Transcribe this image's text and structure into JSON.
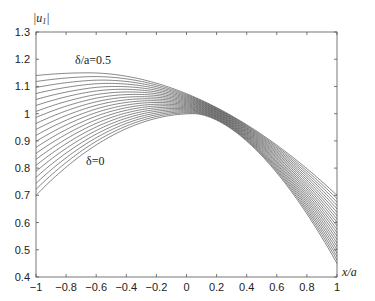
{
  "chart_data": {
    "type": "line",
    "title": "",
    "xlabel": "x/a",
    "ylabel": "|u_1|",
    "xlim": [
      -1,
      1
    ],
    "ylim": [
      0.4,
      1.3
    ],
    "grid": false,
    "xticks": [
      -1,
      -0.8,
      -0.6,
      -0.4,
      -0.2,
      0,
      0.2,
      0.4,
      0.6,
      0.8,
      1
    ],
    "xtick_labels": [
      "−1",
      "−0.8",
      "−0.6",
      "−0.4",
      "−0.2",
      "0",
      "0.2",
      "0.4",
      "0.6",
      "0.8",
      "1"
    ],
    "yticks": [
      0.4,
      0.5,
      0.6,
      0.7,
      0.8,
      0.9,
      1,
      1.1,
      1.2,
      1.3
    ],
    "ytick_labels": [
      "0.4",
      "0.5",
      "0.6",
      "0.7",
      "0.8",
      "0.9",
      "1",
      "1.1",
      "1.2",
      "1.3"
    ],
    "annotations": [
      {
        "text": "δ/a=0.5",
        "x": -0.72,
        "y": 1.19
      },
      {
        "text": "δ=0",
        "x": -0.62,
        "y": 0.795
      }
    ],
    "series_parameter": "δ/a",
    "series_parameter_values": [
      0,
      0.025,
      0.05,
      0.075,
      0.1,
      0.125,
      0.15,
      0.175,
      0.2,
      0.225,
      0.25,
      0.275,
      0.3,
      0.325,
      0.35,
      0.375,
      0.4,
      0.425,
      0.45,
      0.475,
      0.5
    ],
    "series": [
      {
        "name": "δ=0",
        "x": [
          -1,
          -0.5,
          0,
          0.05,
          0.5,
          1
        ],
        "values": [
          0.7,
          0.9,
          0.998,
          1.0,
          0.85,
          0.45
        ]
      },
      {
        "name": "δ/a=0.5",
        "x": [
          -1,
          -0.65,
          -0.5,
          0,
          0.5,
          1
        ],
        "values": [
          1.14,
          1.15,
          1.14,
          1.0,
          0.88,
          0.7
        ]
      }
    ]
  },
  "labels": {
    "ylabel_main": "|u",
    "ylabel_sub": "1",
    "ylabel_end": "|",
    "xlabel": "x/a",
    "ann_top": "δ/a=0.5",
    "ann_bottom": "δ=0"
  }
}
